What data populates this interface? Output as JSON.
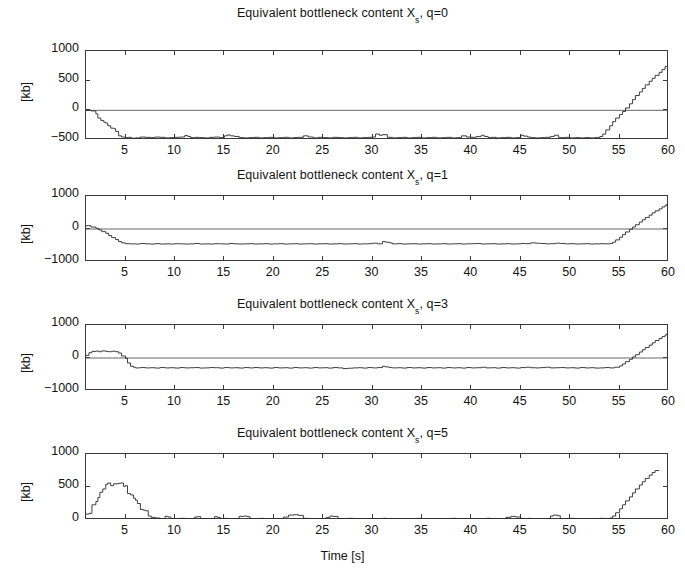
{
  "figure": {
    "xlabel": "Time [s]",
    "ylabel": "[kb]",
    "xticks": [
      5,
      10,
      15,
      20,
      25,
      30,
      35,
      40,
      45,
      50,
      55,
      60
    ],
    "xlim": [
      1,
      60
    ],
    "line_color": "#2a2a2a",
    "zero_line_color": "#555555",
    "axis_color": "#3a3a3a",
    "background": "#ffffff"
  },
  "chart_data": [
    {
      "type": "line",
      "title": "Equivalent bottleneck content X_s, q=0",
      "title_prefix": "Equivalent bottleneck content X",
      "title_sub": "s",
      "title_suffix": ", q=0",
      "xlabel": "",
      "ylabel": "[kb]",
      "xlim": [
        1,
        60
      ],
      "ylim": [
        -500,
        1000
      ],
      "yticks": [
        1000,
        500,
        0,
        -500
      ],
      "grid": false,
      "zero_reference": 0,
      "x": [
        1,
        1.5,
        2,
        2.2,
        2.5,
        2.8,
        3,
        3.2,
        3.5,
        3.8,
        4,
        4.3,
        4.6,
        5,
        5.3,
        5.6,
        6,
        6.5,
        7,
        7.5,
        8,
        8.5,
        9,
        9.5,
        10,
        10.5,
        11,
        11.3,
        11.6,
        12,
        12.5,
        13,
        13.5,
        14,
        14.5,
        15,
        15.3,
        15.6,
        16,
        16.5,
        17,
        17.5,
        18,
        18.5,
        19,
        19.5,
        20,
        20.5,
        21,
        21.5,
        22,
        22.5,
        23,
        23.5,
        24,
        24.5,
        25,
        25.5,
        26,
        26.5,
        27,
        27.5,
        28,
        28.5,
        29,
        29.5,
        30,
        30.3,
        30.7,
        31,
        31.5,
        32,
        32.5,
        33,
        33.5,
        34,
        34.5,
        35,
        35.5,
        36,
        36.5,
        37,
        37.5,
        38,
        38.5,
        39,
        39.5,
        40,
        40.5,
        41,
        41.3,
        41.7,
        42,
        42.5,
        43,
        43.5,
        44,
        44.5,
        45,
        45.3,
        45.7,
        46,
        46.5,
        47,
        47.5,
        48,
        48.4,
        48.8,
        49,
        49.5,
        50,
        50.5,
        51,
        51.5,
        52,
        52.5,
        53,
        53.3,
        53.6,
        54,
        54.3,
        54.6,
        55,
        55.3,
        55.6,
        56,
        56.3,
        56.6,
        57,
        57.3,
        57.6,
        58,
        58.3,
        58.6,
        59,
        59.3,
        59.6,
        60
      ],
      "y": [
        0,
        -10,
        -60,
        -130,
        -170,
        -200,
        -215,
        -260,
        -300,
        -310,
        -355,
        -430,
        -450,
        -460,
        -455,
        -470,
        -465,
        -450,
        -455,
        -460,
        -450,
        -455,
        -465,
        -460,
        -455,
        -450,
        -425,
        -440,
        -460,
        -455,
        -460,
        -465,
        -455,
        -450,
        -460,
        -430,
        -415,
        -430,
        -440,
        -460,
        -465,
        -460,
        -455,
        -465,
        -460,
        -455,
        -465,
        -460,
        -455,
        -465,
        -460,
        -455,
        -430,
        -450,
        -465,
        -455,
        -460,
        -465,
        -455,
        -460,
        -465,
        -460,
        -455,
        -465,
        -460,
        -455,
        -450,
        -400,
        -420,
        -410,
        -455,
        -465,
        -460,
        -455,
        -465,
        -460,
        -455,
        -465,
        -460,
        -455,
        -465,
        -460,
        -455,
        -465,
        -460,
        -430,
        -450,
        -455,
        -440,
        -420,
        -440,
        -460,
        -455,
        -465,
        -460,
        -455,
        -465,
        -460,
        -420,
        -435,
        -450,
        -460,
        -465,
        -460,
        -455,
        -440,
        -420,
        -455,
        -460,
        -455,
        -465,
        -460,
        -465,
        -460,
        -465,
        -460,
        -440,
        -400,
        -330,
        -260,
        -190,
        -130,
        -70,
        -20,
        40,
        110,
        180,
        250,
        310,
        370,
        430,
        490,
        540,
        590,
        640,
        690,
        740
      ]
    },
    {
      "type": "line",
      "title": "Equivalent bottleneck content X_s, q=1",
      "title_prefix": "Equivalent bottleneck content X",
      "title_sub": "s",
      "title_suffix": ", q=1",
      "xlabel": "",
      "ylabel": "[kb]",
      "xlim": [
        1,
        60
      ],
      "ylim": [
        -1000,
        1000
      ],
      "yticks": [
        1000,
        0,
        -1000
      ],
      "grid": false,
      "zero_reference": 0,
      "x": [
        1,
        1.5,
        2,
        2.3,
        2.6,
        3,
        3.3,
        3.6,
        4,
        4.3,
        4.6,
        5,
        5.5,
        6,
        6.5,
        7,
        7.5,
        8,
        8.5,
        9,
        9.5,
        10,
        10.5,
        11,
        11.5,
        12,
        12.5,
        13,
        13.5,
        14,
        14.5,
        15,
        15.5,
        16,
        16.5,
        17,
        17.5,
        18,
        18.5,
        19,
        19.5,
        20,
        20.5,
        21,
        21.5,
        22,
        22.5,
        23,
        23.5,
        24,
        24.5,
        25,
        25.5,
        26,
        26.5,
        27,
        27.5,
        28,
        28.5,
        29,
        29.5,
        30,
        30.5,
        31,
        31.3,
        31.7,
        32,
        32.5,
        33,
        33.5,
        34,
        34.5,
        35,
        35.5,
        36,
        36.5,
        37,
        37.5,
        38,
        38.5,
        39,
        39.5,
        40,
        40.5,
        41,
        41.5,
        42,
        42.5,
        43,
        43.5,
        44,
        44.5,
        45,
        45.5,
        46,
        46.5,
        47,
        47.5,
        48,
        48.5,
        49,
        49.5,
        50,
        50.5,
        51,
        51.5,
        52,
        52.5,
        53,
        53.5,
        54,
        54.3,
        54.6,
        55,
        55.3,
        55.6,
        56,
        56.3,
        56.6,
        57,
        57.3,
        57.6,
        58,
        58.3,
        58.6,
        59,
        59.3,
        59.6,
        60
      ],
      "y": [
        100,
        60,
        20,
        -30,
        -80,
        -130,
        -200,
        -260,
        -320,
        -380,
        -420,
        -445,
        -450,
        -455,
        -440,
        -450,
        -455,
        -445,
        -455,
        -450,
        -455,
        -445,
        -450,
        -455,
        -450,
        -440,
        -455,
        -450,
        -455,
        -445,
        -450,
        -455,
        -440,
        -450,
        -455,
        -450,
        -445,
        -455,
        -450,
        -445,
        -455,
        -450,
        -445,
        -455,
        -450,
        -445,
        -455,
        -450,
        -445,
        -455,
        -450,
        -445,
        -455,
        -450,
        -445,
        -455,
        -450,
        -445,
        -455,
        -450,
        -445,
        -430,
        -450,
        -380,
        -400,
        -420,
        -450,
        -445,
        -455,
        -450,
        -445,
        -455,
        -450,
        -445,
        -455,
        -450,
        -445,
        -455,
        -450,
        -445,
        -455,
        -450,
        -445,
        -440,
        -455,
        -450,
        -445,
        -455,
        -450,
        -445,
        -455,
        -450,
        -440,
        -445,
        -420,
        -430,
        -440,
        -450,
        -445,
        -430,
        -440,
        -450,
        -445,
        -455,
        -450,
        -445,
        -455,
        -450,
        -445,
        -450,
        -440,
        -400,
        -330,
        -250,
        -170,
        -90,
        -10,
        60,
        130,
        210,
        280,
        350,
        420,
        490,
        550,
        610,
        670,
        720,
        760
      ]
    },
    {
      "type": "line",
      "title": "Equivalent bottleneck content X_s, q=3",
      "title_prefix": "Equivalent bottleneck content X",
      "title_sub": "s",
      "title_suffix": ", q=3",
      "xlabel": "",
      "ylabel": "[kb]",
      "xlim": [
        1,
        60
      ],
      "ylim": [
        -1000,
        1000
      ],
      "yticks": [
        1000,
        0,
        -1000
      ],
      "grid": false,
      "zero_reference": 0,
      "x": [
        1,
        1.3,
        1.6,
        2,
        2.3,
        2.6,
        3,
        3.3,
        3.6,
        4,
        4.3,
        4.6,
        5,
        5.2,
        5.5,
        5.8,
        6,
        6.5,
        7,
        7.5,
        8,
        8.5,
        9,
        9.5,
        10,
        10.5,
        11,
        11.5,
        12,
        12.5,
        13,
        13.5,
        14,
        14.5,
        15,
        15.5,
        16,
        16.5,
        17,
        17.5,
        18,
        18.5,
        19,
        19.5,
        20,
        20.5,
        21,
        21.5,
        22,
        22.5,
        23,
        23.5,
        24,
        24.5,
        25,
        25.5,
        26,
        26.5,
        27,
        27.5,
        28,
        28.5,
        29,
        29.5,
        30,
        30.5,
        31,
        31.3,
        31.7,
        32,
        32.5,
        33,
        33.5,
        34,
        34.5,
        35,
        35.5,
        36,
        36.5,
        37,
        37.5,
        38,
        38.5,
        39,
        39.5,
        40,
        40.5,
        41,
        41.5,
        42,
        42.5,
        43,
        43.5,
        44,
        44.5,
        45,
        45.5,
        46,
        46.5,
        47,
        47.5,
        48,
        48.5,
        49,
        49.5,
        50,
        50.5,
        51,
        51.5,
        52,
        52.5,
        53,
        53.5,
        54,
        54.5,
        55,
        55.3,
        55.6,
        56,
        56.3,
        56.6,
        57,
        57.3,
        57.6,
        58,
        58.3,
        58.6,
        59,
        59.3,
        59.6,
        60
      ],
      "y": [
        80,
        160,
        200,
        210,
        190,
        215,
        200,
        190,
        205,
        190,
        150,
        60,
        -10,
        -150,
        -250,
        -280,
        -300,
        -290,
        -300,
        -295,
        -305,
        -290,
        -300,
        -295,
        -305,
        -290,
        -300,
        -295,
        -290,
        -305,
        -300,
        -290,
        -295,
        -305,
        -290,
        -300,
        -295,
        -305,
        -290,
        -300,
        -290,
        -300,
        -295,
        -305,
        -290,
        -300,
        -295,
        -305,
        -290,
        -300,
        -295,
        -305,
        -290,
        -300,
        -295,
        -305,
        -290,
        -300,
        -320,
        -310,
        -300,
        -295,
        -305,
        -290,
        -300,
        -290,
        -250,
        -270,
        -290,
        -300,
        -295,
        -305,
        -290,
        -300,
        -295,
        -305,
        -290,
        -300,
        -295,
        -305,
        -290,
        -300,
        -295,
        -305,
        -290,
        -300,
        -295,
        -280,
        -300,
        -295,
        -305,
        -290,
        -300,
        -295,
        -305,
        -290,
        -280,
        -295,
        -300,
        -290,
        -280,
        -300,
        -295,
        -290,
        -300,
        -295,
        -305,
        -290,
        -300,
        -295,
        -305,
        -300,
        -290,
        -300,
        -280,
        -240,
        -180,
        -110,
        -40,
        30,
        100,
        180,
        250,
        320,
        390,
        460,
        530,
        590,
        650,
        700,
        750,
        800
      ]
    },
    {
      "type": "line",
      "title": "Equivalent bottleneck content X_s, q=5",
      "title_prefix": "Equivalent bottleneck content X",
      "title_sub": "s",
      "title_suffix": ", q=5",
      "xlabel": "Time [s]",
      "ylabel": "[kb]",
      "xlim": [
        1,
        60
      ],
      "ylim": [
        0,
        1000
      ],
      "yticks": [
        1000,
        500,
        0
      ],
      "grid": false,
      "zero_reference": 0,
      "x": [
        1,
        1.3,
        1.6,
        2,
        2.2,
        2.4,
        2.7,
        3,
        3.2,
        3.5,
        3.8,
        4,
        4.2,
        4.5,
        4.8,
        5,
        5.2,
        5.5,
        5.8,
        6,
        6.2,
        6.5,
        6.8,
        7,
        7.3,
        7.6,
        8,
        8.5,
        9,
        9.3,
        9.6,
        10,
        10.5,
        11,
        11.5,
        12,
        12.3,
        12.6,
        13,
        13.5,
        14,
        14.3,
        14.6,
        15,
        15.3,
        15.6,
        16,
        16.5,
        17,
        17.3,
        17.6,
        18,
        18.5,
        19,
        19.5,
        20,
        20.5,
        21,
        21.5,
        22,
        22.5,
        23,
        23.5,
        24,
        24.5,
        25,
        25.3,
        25.7,
        26,
        26.5,
        27,
        27.5,
        28,
        28.5,
        29,
        29.5,
        30,
        30.5,
        31,
        31.5,
        32,
        32.5,
        33,
        33.5,
        34,
        34.5,
        35,
        35.5,
        36,
        36.5,
        37,
        37.5,
        38,
        38.5,
        39,
        39.5,
        40,
        40.5,
        41,
        41.5,
        42,
        42.5,
        43,
        43.5,
        44,
        44.5,
        45,
        45.3,
        45.7,
        46,
        46.5,
        47,
        47.5,
        48,
        48.3,
        48.7,
        49,
        49.5,
        50,
        50.5,
        51,
        51.5,
        52,
        52.5,
        53,
        53.5,
        54,
        54.3,
        54.6,
        55,
        55.3,
        55.6,
        56,
        56.3,
        56.6,
        57,
        57.3,
        57.6,
        58,
        58.3,
        58.6,
        59,
        59.3,
        59.6,
        60
      ],
      "y": [
        90,
        100,
        230,
        280,
        340,
        420,
        470,
        540,
        560,
        520,
        550,
        545,
        555,
        560,
        510,
        520,
        400,
        380,
        330,
        300,
        250,
        160,
        150,
        140,
        60,
        40,
        30,
        20,
        55,
        45,
        15,
        20,
        25,
        15,
        10,
        45,
        50,
        20,
        15,
        10,
        50,
        40,
        15,
        25,
        15,
        10,
        20,
        55,
        60,
        50,
        20,
        15,
        25,
        15,
        20,
        10,
        15,
        45,
        75,
        80,
        70,
        25,
        15,
        20,
        15,
        10,
        40,
        60,
        55,
        20,
        15,
        25,
        15,
        20,
        10,
        15,
        20,
        15,
        25,
        15,
        20,
        10,
        15,
        20,
        15,
        25,
        15,
        20,
        10,
        15,
        20,
        15,
        25,
        15,
        20,
        10,
        15,
        20,
        15,
        25,
        15,
        20,
        10,
        40,
        55,
        45,
        20,
        15,
        25,
        15,
        20,
        10,
        15,
        60,
        75,
        65,
        20,
        15,
        25,
        15,
        20,
        10,
        15,
        20,
        25,
        15,
        30,
        60,
        110,
        170,
        230,
        290,
        350,
        410,
        470,
        530,
        580,
        630,
        680,
        720,
        750
      ]
    }
  ]
}
